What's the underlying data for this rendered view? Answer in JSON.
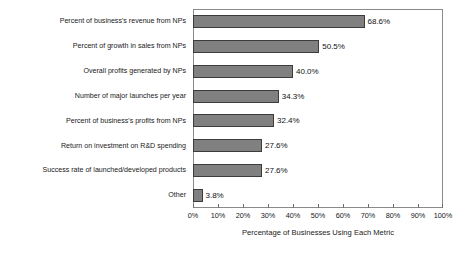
{
  "chart_data": {
    "type": "bar",
    "orientation": "horizontal",
    "title": "",
    "xlabel": "Percentage of Businesses Using Each Metric",
    "ylabel": "",
    "xlim": [
      0,
      100
    ],
    "grid": false,
    "legend": null,
    "bar_color": "#808080",
    "bar_edge_color": "#3c3c3c",
    "frame_color": "#8a8a8a",
    "xticks": [
      0,
      10,
      20,
      30,
      40,
      50,
      60,
      70,
      80,
      90,
      100
    ],
    "xtick_labels": [
      "0%",
      "10%",
      "20%",
      "30%",
      "40%",
      "50%",
      "60%",
      "70%",
      "80%",
      "90%",
      "100%"
    ],
    "categories": [
      "Percent of business's revenue from NPs",
      "Percent of growth in sales from NPs",
      "Overall profits generated by NPs",
      "Number of major launches per year",
      "Percent of business's profits from NPs",
      "Return on investment on R&D spending",
      "Success rate of launched/developed products",
      "Other"
    ],
    "values": [
      68.6,
      50.5,
      40.0,
      34.3,
      32.4,
      27.6,
      27.6,
      3.8
    ],
    "value_labels": [
      "68.6%",
      "50.5%",
      "40.0%",
      "34.3%",
      "32.4%",
      "27.6%",
      "27.6%",
      "3.8%"
    ]
  }
}
